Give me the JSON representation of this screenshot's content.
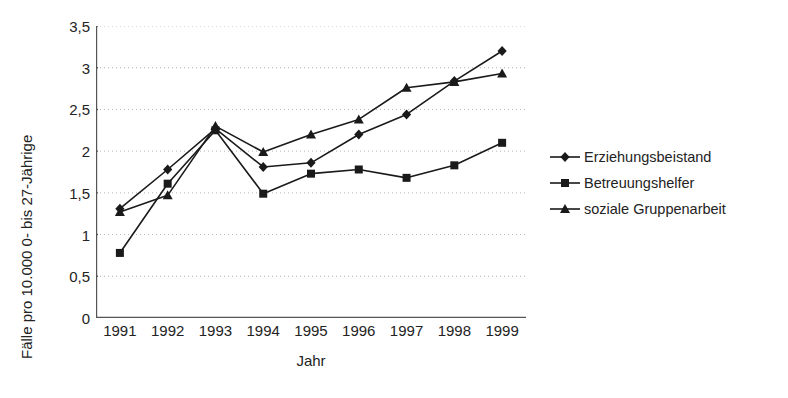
{
  "chart_data": {
    "type": "line",
    "title": "",
    "xlabel": "Jahr",
    "ylabel": "Fälle pro 10.000 0- bis 27-Jährige",
    "categories": [
      "1991",
      "1992",
      "1993",
      "1994",
      "1995",
      "1996",
      "1997",
      "1998",
      "1999"
    ],
    "x": [
      1991,
      1992,
      1993,
      1994,
      1995,
      1996,
      1997,
      1998,
      1999
    ],
    "ylim": [
      0,
      3.5
    ],
    "yticks": [
      "0",
      "0,5",
      "1",
      "1,5",
      "2",
      "2,5",
      "3",
      "3,5"
    ],
    "ytick_values": [
      0,
      0.5,
      1,
      1.5,
      2,
      2.5,
      3,
      3.5
    ],
    "grid": "horizontal-dotted",
    "legend_position": "right",
    "series": [
      {
        "name": "Erziehungsbeistand",
        "marker": "diamond",
        "color": "#1a1a1a",
        "values": [
          1.31,
          1.78,
          2.27,
          1.81,
          1.86,
          2.2,
          2.44,
          2.84,
          3.2
        ]
      },
      {
        "name": "Betreuungshelfer",
        "marker": "square",
        "color": "#1a1a1a",
        "values": [
          0.78,
          1.61,
          2.25,
          1.49,
          1.73,
          1.78,
          1.68,
          1.83,
          2.1
        ]
      },
      {
        "name": "soziale Gruppenarbeit",
        "marker": "triangle",
        "color": "#1a1a1a",
        "values": [
          1.27,
          1.47,
          2.3,
          1.99,
          2.2,
          2.38,
          2.76,
          2.83,
          2.93
        ]
      }
    ]
  },
  "axes": {
    "y_title": "Fälle pro 10.000 0- bis 27-Jährige",
    "x_title": "Jahr"
  },
  "legend": {
    "items": [
      {
        "label": "Erziehungsbeistand",
        "marker": "diamond"
      },
      {
        "label": "Betreuungshelfer",
        "marker": "square"
      },
      {
        "label": "soziale Gruppenarbeit",
        "marker": "triangle"
      }
    ]
  },
  "style": {
    "ink": "#1a1a1a",
    "axis": "#555555",
    "grid": "#b5b5b5",
    "background": "#ffffff"
  }
}
